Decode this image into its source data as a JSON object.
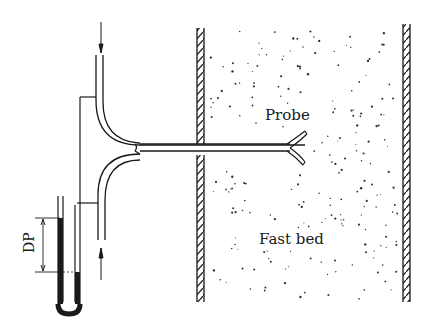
{
  "diagram": {
    "labels": {
      "probe": "Probe",
      "fast_bed": "Fast bed",
      "dp": "DP"
    },
    "elements": {
      "bed_column": "Fast bed column with hatched walls",
      "probe_tube": "Forked probe inserted through column wall",
      "manometer": "U-tube manometer measuring DP",
      "inlet_arrow": "Flow arrow into upper tube (downward)",
      "outlet_arrow": "Flow arrow in lower tube (upward)"
    },
    "colors": {
      "line": "#1a1a1a",
      "background": "#ffffff",
      "particles": "#333333"
    }
  }
}
